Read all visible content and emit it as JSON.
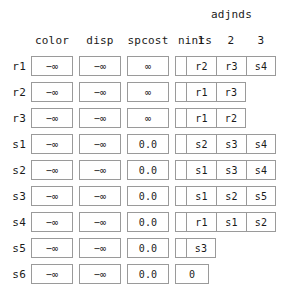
{
  "table": {
    "group_header": "adjnds",
    "columns": [
      {
        "key": "color",
        "label": "color"
      },
      {
        "key": "disp",
        "label": "disp"
      },
      {
        "key": "spcost",
        "label": "spcost"
      },
      {
        "key": "nints",
        "label": "nints"
      }
    ],
    "adj_headers": [
      "1",
      "2",
      "3"
    ],
    "rows": [
      {
        "label": "r1",
        "color": "−∞",
        "disp": "−∞",
        "spcost": "∞",
        "nints": "3",
        "adjnds": [
          "r2",
          "r3",
          "s4"
        ]
      },
      {
        "label": "r2",
        "color": "−∞",
        "disp": "−∞",
        "spcost": "∞",
        "nints": "2",
        "adjnds": [
          "r1",
          "r3"
        ]
      },
      {
        "label": "r3",
        "color": "−∞",
        "disp": "−∞",
        "spcost": "∞",
        "nints": "2",
        "adjnds": [
          "r1",
          "r2"
        ]
      },
      {
        "label": "s1",
        "color": "−∞",
        "disp": "−∞",
        "spcost": "0.0",
        "nints": "3",
        "adjnds": [
          "s2",
          "s3",
          "s4"
        ]
      },
      {
        "label": "s2",
        "color": "−∞",
        "disp": "−∞",
        "spcost": "0.0",
        "nints": "3",
        "adjnds": [
          "s1",
          "s3",
          "s4"
        ]
      },
      {
        "label": "s3",
        "color": "−∞",
        "disp": "−∞",
        "spcost": "0.0",
        "nints": "3",
        "adjnds": [
          "s1",
          "s2",
          "s5"
        ]
      },
      {
        "label": "s4",
        "color": "−∞",
        "disp": "−∞",
        "spcost": "0.0",
        "nints": "3",
        "adjnds": [
          "r1",
          "s1",
          "s2"
        ]
      },
      {
        "label": "s5",
        "color": "−∞",
        "disp": "−∞",
        "spcost": "0.0",
        "nints": "1",
        "adjnds": [
          "s3"
        ]
      },
      {
        "label": "s6",
        "color": "−∞",
        "disp": "−∞",
        "spcost": "0.0",
        "nints": "0",
        "adjnds": []
      }
    ]
  }
}
